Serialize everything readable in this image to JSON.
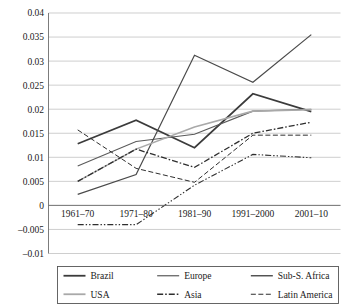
{
  "chart_data": {
    "type": "line",
    "title": "",
    "subtitle": "",
    "xlabel": "",
    "ylabel": "",
    "categories": [
      "1961–70",
      "1971–80",
      "1981–90",
      "1991–2000",
      "2001–10"
    ],
    "ylim": [
      -0.01,
      0.04
    ],
    "yticks": [
      -0.01,
      -0.005,
      0,
      0.005,
      0.01,
      0.015,
      0.02,
      0.025,
      0.03,
      0.035,
      0.04
    ],
    "ytick_labels": [
      "–0.01",
      "–0.005",
      "0",
      "0.005",
      "0.01",
      "0.015",
      "0.02",
      "0.025",
      "0.03",
      "0.035",
      "0.04"
    ],
    "grid": true,
    "legend_position": "bottom",
    "series": [
      {
        "name": "Brazil",
        "values": [
          0.0128,
          0.0177,
          0.012,
          0.0232,
          0.0195
        ],
        "color": "#3b3b3b",
        "style": "solid",
        "width": 1.7
      },
      {
        "name": "Europe",
        "values": [
          0.0082,
          0.0133,
          0.0148,
          0.0196,
          0.02
        ],
        "color": "#5a5a5a",
        "style": "solid",
        "width": 1.1
      },
      {
        "name": "Sub-S. Africa",
        "values": [
          0.0023,
          0.0064,
          0.0312,
          0.0256,
          0.0355
        ],
        "color": "#4a4a4a",
        "style": "solid",
        "width": 1.2
      },
      {
        "name": "USA",
        "values": [
          0.005,
          0.0117,
          0.0163,
          0.0196,
          0.0199
        ],
        "color": "#a9a9a9",
        "style": "solid",
        "width": 1.6
      },
      {
        "name": "Asia",
        "values": [
          0.005,
          0.0117,
          0.0079,
          0.015,
          0.0173
        ],
        "color": "#2e2e2e",
        "style": "dashdot",
        "width": 1.3
      },
      {
        "name": "Latin America",
        "values": [
          0.0157,
          0.0077,
          0.0048,
          0.0146,
          0.0146
        ],
        "color": "#2e2e2e",
        "style": "dashed",
        "width": 1.0
      },
      {
        "name": "USA-lower",
        "values": [
          -0.004,
          -0.004,
          0.0042,
          0.0106,
          0.0099
        ],
        "color": "#2e2e2e",
        "style": "dashdotdot",
        "width": 1.1
      }
    ],
    "legend_entries": [
      {
        "label": "Brazil",
        "style": "solid",
        "color": "#3b3b3b",
        "width": 1.8
      },
      {
        "label": "Europe",
        "style": "solid",
        "color": "#5a5a5a",
        "width": 1.2
      },
      {
        "label": "Sub-S. Africa",
        "style": "solid",
        "color": "#4a4a4a",
        "width": 1.4
      },
      {
        "label": "USA",
        "style": "solid",
        "color": "#a9a9a9",
        "width": 1.8
      },
      {
        "label": "Asia",
        "style": "dashdot",
        "color": "#2e2e2e",
        "width": 1.5
      },
      {
        "label": "Latin America",
        "style": "dashed",
        "color": "#2e2e2e",
        "width": 1.2
      }
    ]
  }
}
